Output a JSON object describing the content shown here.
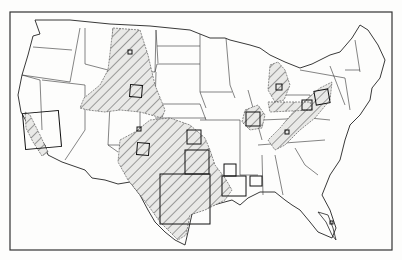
{
  "figure": {
    "type": "outline map",
    "frame": {
      "x": 10,
      "y": 12,
      "width": 382,
      "height": 238
    },
    "colors": {
      "background": "#fdfdfc",
      "outline": "#222222",
      "hatch": "#555555",
      "hatch_fill": "#e8e8e6",
      "box": "#111111"
    }
  },
  "hatched_regions": [
    {
      "name": "great-plains-region",
      "label": ""
    },
    {
      "name": "south-central-region",
      "label": ""
    },
    {
      "name": "central-valley-california",
      "label": ""
    },
    {
      "name": "michigan-basin",
      "label": ""
    },
    {
      "name": "illinois-basin",
      "label": ""
    },
    {
      "name": "appalachian-region",
      "label": ""
    },
    {
      "name": "ohio-region",
      "label": ""
    }
  ],
  "study_boxes_count": 20
}
